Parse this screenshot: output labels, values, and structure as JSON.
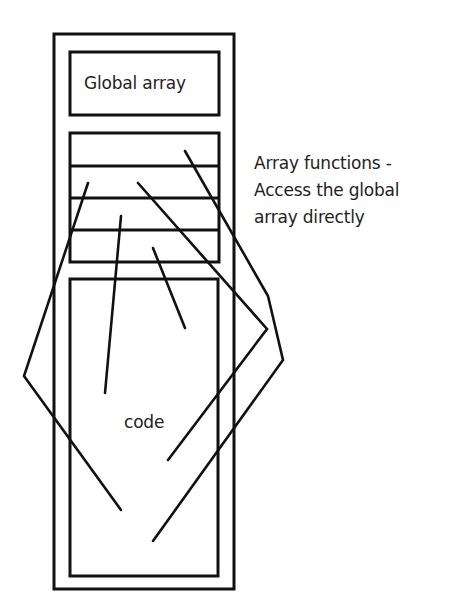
{
  "diagram": {
    "global_array_label": "Global array",
    "code_label": "code",
    "annotation": {
      "line1": "Array functions -",
      "line2": "Access the global",
      "line3": "array directly"
    },
    "stroke_color": "#111111",
    "background_color": "#ffffff",
    "function_slots": 4
  }
}
